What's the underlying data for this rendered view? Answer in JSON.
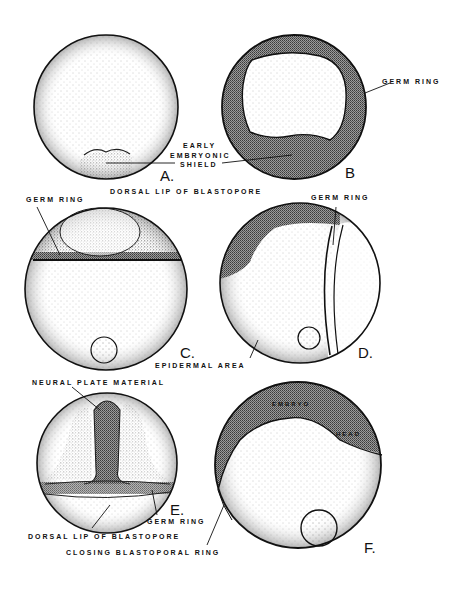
{
  "figure": {
    "panels": [
      {
        "id": "A",
        "letter": "A."
      },
      {
        "id": "B",
        "letter": "B"
      },
      {
        "id": "C",
        "letter": "C."
      },
      {
        "id": "D",
        "letter": "D."
      },
      {
        "id": "E",
        "letter": "E."
      },
      {
        "id": "F",
        "letter": "F."
      }
    ],
    "labels": {
      "early": "EARLY",
      "embryonic": "EMBRYONIC",
      "shield": "SHIELD",
      "dorsal_lip_top": "DORSAL LIP OF BLASTOPORE",
      "germ_ring_b": "GERM RING",
      "germ_ring_c": "GERM RING",
      "germ_ring_d": "GERM RING",
      "epidermal_area": "EPIDERMAL AREA",
      "neural_plate": "NEURAL PLATE MATERIAL",
      "germ_ring_e": "GERM RING",
      "dorsal_lip_bottom": "DORSAL LIP OF BLASTOPORE",
      "closing_ring": "CLOSING BLASTOPORAL RING",
      "embryo": "EMBRYO",
      "head": "HEAD"
    },
    "colors": {
      "ink": "#111111",
      "background": "#ffffff"
    }
  }
}
